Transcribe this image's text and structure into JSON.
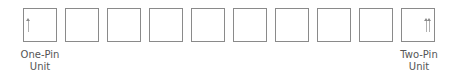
{
  "diagram": {
    "box_count": 10,
    "boxes": [
      {
        "index": 1,
        "pins": 1
      },
      {
        "index": 2,
        "pins": 0
      },
      {
        "index": 3,
        "pins": 0
      },
      {
        "index": 4,
        "pins": 0
      },
      {
        "index": 5,
        "pins": 0
      },
      {
        "index": 6,
        "pins": 0
      },
      {
        "index": 7,
        "pins": 0
      },
      {
        "index": 8,
        "pins": 0
      },
      {
        "index": 9,
        "pins": 0
      },
      {
        "index": 10,
        "pins": 2
      }
    ],
    "labels": {
      "left_line1": "One-Pin",
      "left_line2": "Unit",
      "right_line1": "Two-Pin",
      "right_line2": "Unit"
    },
    "colors": {
      "border": "#8a8a8a",
      "text": "#555555"
    }
  }
}
